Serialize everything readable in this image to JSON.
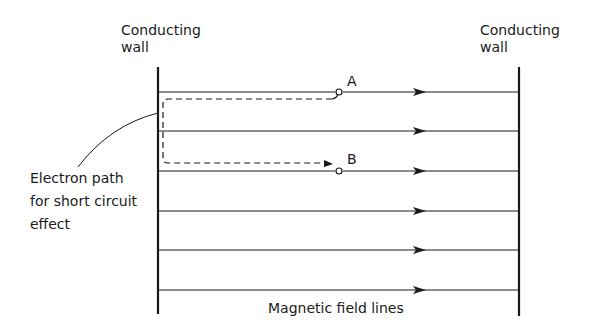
{
  "labels": {
    "left_wall_line1": "Conducting",
    "left_wall_line2": "wall",
    "right_wall_line1": "Conducting",
    "right_wall_line2": "wall",
    "point_a": "A",
    "point_b": "B",
    "electron_path_line1": "Electron path",
    "electron_path_line2": "for short circuit",
    "electron_path_line3": "effect",
    "field_lines": "Magnetic field lines"
  },
  "geometry": {
    "left_wall_x": 158,
    "right_wall_x": 519,
    "wall_top": 67,
    "wall_bottom": 315,
    "field_line_y": [
      92,
      131,
      171,
      211,
      250,
      290
    ],
    "arrow_x": 420
  },
  "colors": {
    "ink": "#1a1a1a",
    "background": "#ffffff"
  }
}
